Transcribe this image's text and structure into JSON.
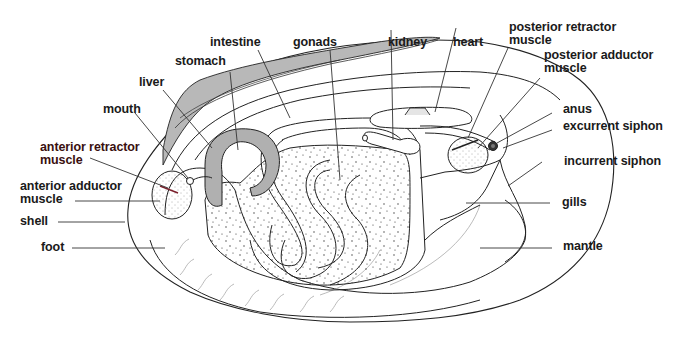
{
  "diagram": {
    "colors": {
      "outline": "#222222",
      "shaded": "#b8b8b8",
      "stipple": "#333333",
      "leader": "#333333",
      "background": "#ffffff"
    },
    "labels": {
      "intestine": "intestine",
      "gonads": "gonads",
      "kidney": "kidney",
      "heart": "heart",
      "posterior_retractor_muscle": "posterior retractor\nmuscle",
      "posterior_adductor_muscle": "posterior adductor\nmuscle",
      "stomach": "stomach",
      "liver": "liver",
      "mouth": "mouth",
      "anterior_retractor_muscle": "anterior retractor\nmuscle",
      "anterior_adductor_muscle": "anterior adductor\nmuscle",
      "shell": "shell",
      "foot": "foot",
      "anus": "anus",
      "excurrent_siphon": "excurrent siphon",
      "incurrent_siphon": "incurrent siphon",
      "gills": "gills",
      "mantle": "mantle"
    }
  }
}
